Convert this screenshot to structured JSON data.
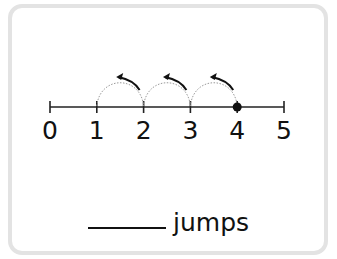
{
  "number_line": {
    "min": 0,
    "max": 5,
    "labels": [
      "0",
      "1",
      "2",
      "3",
      "4",
      "5"
    ],
    "marked_point": 4,
    "jumps": [
      {
        "from": 4,
        "to": 3,
        "direction": "left"
      },
      {
        "from": 3,
        "to": 2,
        "direction": "left"
      },
      {
        "from": 2,
        "to": 1,
        "direction": "left"
      }
    ]
  },
  "answer": {
    "blank_value": "",
    "unit_label": "jumps"
  },
  "colors": {
    "line": "#222222",
    "arc": "#9a9a9a",
    "border": "#e3e3e3"
  }
}
